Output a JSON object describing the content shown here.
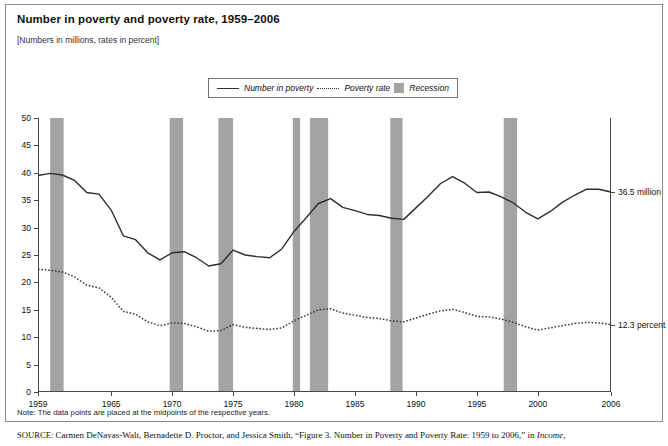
{
  "title": "Number in poverty and poverty rate, 1959–2006",
  "subtitle": "[Numbers in millions, rates in percent]",
  "legend": {
    "items": [
      {
        "label": "Number in poverty",
        "style": "solid-line",
        "color": "#2e2e2e"
      },
      {
        "label": "Poverty rate",
        "style": "dotted-line",
        "color": "#3a3a3a"
      },
      {
        "label": "Recession",
        "style": "filled-box",
        "color": "#a3a3a3"
      }
    ]
  },
  "annotations": {
    "number_in_poverty": "36.5 million",
    "poverty_rate": "12.3 percent"
  },
  "note": "Note: The data points are placed at the midpoints of the respective years.",
  "source_prefix": "SOURCE:",
  "source_text": " Carmen DeNavas-Walt, Bernadette D. Proctor, and Jessica Smith, “Figure 3. Number in Poverty and Poverty Rate: 1959 to 2006,” in ",
  "source_italic": "Income,",
  "chart_data": {
    "type": "line",
    "title": "Number in poverty and poverty rate, 1959–2006",
    "subtitle": "[Numbers in millions, rates in percent]",
    "xlabel": "",
    "ylabel": "",
    "xlim": [
      1959,
      2006
    ],
    "ylim": [
      0,
      50
    ],
    "ytick_values": [
      0,
      5,
      10,
      15,
      20,
      25,
      30,
      35,
      40,
      45,
      50
    ],
    "xtick_values": [
      1959,
      1965,
      1970,
      1975,
      1980,
      1985,
      1990,
      1995,
      2000,
      2006
    ],
    "grid": false,
    "legend_position": "top-center",
    "x": [
      1959,
      1960,
      1961,
      1962,
      1963,
      1964,
      1965,
      1966,
      1967,
      1968,
      1969,
      1970,
      1971,
      1972,
      1973,
      1974,
      1975,
      1976,
      1977,
      1978,
      1979,
      1980,
      1981,
      1982,
      1983,
      1984,
      1985,
      1986,
      1987,
      1988,
      1989,
      1990,
      1991,
      1992,
      1993,
      1994,
      1995,
      1996,
      1997,
      1998,
      1999,
      2000,
      2001,
      2002,
      2003,
      2004,
      2005,
      2006
    ],
    "series": [
      {
        "name": "Number in poverty",
        "units": "millions",
        "style": "solid",
        "color": "#2e2e2e",
        "values": [
          39.5,
          39.9,
          39.6,
          38.6,
          36.4,
          36.1,
          33.2,
          28.5,
          27.8,
          25.4,
          24.1,
          25.4,
          25.6,
          24.5,
          23.0,
          23.4,
          25.9,
          25.0,
          24.7,
          24.5,
          26.1,
          29.3,
          31.8,
          34.4,
          35.3,
          33.7,
          33.1,
          32.4,
          32.2,
          31.7,
          31.5,
          33.6,
          35.7,
          38.0,
          39.3,
          38.1,
          36.4,
          36.5,
          35.6,
          34.5,
          32.8,
          31.6,
          32.9,
          34.6,
          35.9,
          37.0,
          37.0,
          36.5
        ],
        "end_label": "36.5 million"
      },
      {
        "name": "Poverty rate",
        "units": "percent",
        "style": "dotted",
        "color": "#3a3a3a",
        "values": [
          22.4,
          22.2,
          21.9,
          21.0,
          19.5,
          19.0,
          17.3,
          14.7,
          14.2,
          12.8,
          12.1,
          12.6,
          12.5,
          11.9,
          11.1,
          11.2,
          12.3,
          11.8,
          11.6,
          11.4,
          11.7,
          13.0,
          14.0,
          15.0,
          15.2,
          14.4,
          14.0,
          13.6,
          13.4,
          13.0,
          12.8,
          13.5,
          14.2,
          14.8,
          15.1,
          14.5,
          13.8,
          13.7,
          13.3,
          12.7,
          11.9,
          11.3,
          11.7,
          12.1,
          12.5,
          12.7,
          12.6,
          12.3
        ],
        "end_label": "12.3 percent"
      }
    ],
    "recession_bands": [
      {
        "start": 1960.0,
        "end": 1961.1
      },
      {
        "start": 1969.8,
        "end": 1970.9
      },
      {
        "start": 1973.8,
        "end": 1975.0
      },
      {
        "start": 1979.9,
        "end": 1980.5
      },
      {
        "start": 1981.3,
        "end": 1982.8
      },
      {
        "start": 1987.9,
        "end": 1988.9
      },
      {
        "start": 1997.2,
        "end": 1998.3
      }
    ],
    "recession_color": "#a3a3a3"
  }
}
